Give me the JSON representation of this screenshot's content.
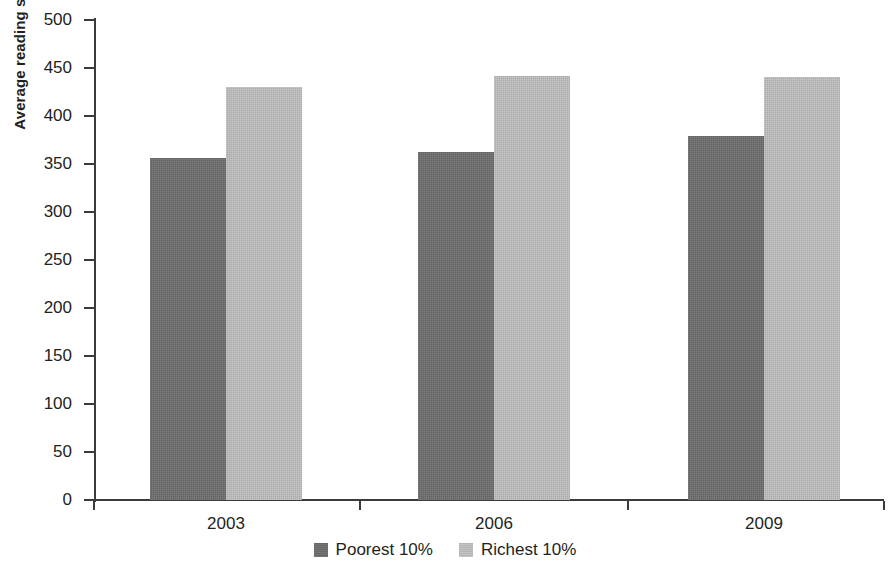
{
  "chart_data": {
    "type": "bar",
    "title": "",
    "subtitle": "",
    "xlabel": "",
    "ylabel": "Average reading score",
    "categories": [
      "2003",
      "2006",
      "2009"
    ],
    "series": [
      {
        "name": "Poorest 10%",
        "color": "#6e6e6e",
        "values": [
          356,
          362,
          379
        ]
      },
      {
        "name": "Richest 10%",
        "color": "#bebebe",
        "values": [
          430,
          442,
          441
        ]
      }
    ],
    "ylim": [
      0,
      500
    ],
    "y_ticks": [
      0,
      50,
      100,
      150,
      200,
      250,
      300,
      350,
      400,
      450,
      500
    ],
    "y_tick_labels": [
      "0",
      "50",
      "100",
      "150",
      "200",
      "250",
      "300",
      "350",
      "400",
      "450",
      "500"
    ],
    "grid": false,
    "legend_position": "bottom",
    "legend": [
      "Poorest 10%",
      "Richest 10%"
    ]
  },
  "axes": {
    "y_title": "Average reading score"
  }
}
